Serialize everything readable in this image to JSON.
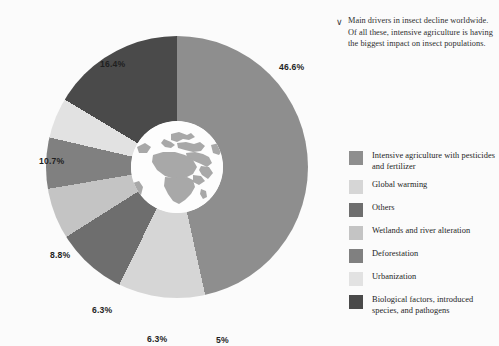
{
  "caption": {
    "marker": "∨",
    "text": "Main drivers in insect decline worldwide. Of all these, intensive agriculture is having the biggest impact on insect populations."
  },
  "legend": {
    "items": [
      {
        "label": "Intensive agriculture with pesticides and fertilizer",
        "color": "#8e8e8e"
      },
      {
        "label": "Global warming",
        "color": "#d6d6d6"
      },
      {
        "label": "Others",
        "color": "#6e6e6e"
      },
      {
        "label": "Wetlands and river alteration",
        "color": "#c4c4c4"
      },
      {
        "label": "Deforestation",
        "color": "#808080"
      },
      {
        "label": "Urbanization",
        "color": "#e2e2e2"
      },
      {
        "label": "Biological factors, introduced species, and pathogens",
        "color": "#4a4a4a"
      }
    ]
  },
  "chart_data": {
    "type": "pie",
    "title": "Main drivers in insect decline worldwide",
    "labels": [
      "Intensive agriculture with pesticides and fertilizer",
      "Global warming",
      "Others",
      "Wetlands and river alteration",
      "Deforestation",
      "Urbanization",
      "Biological factors, introduced species, and pathogens"
    ],
    "values": [
      46.6,
      10.7,
      8.8,
      6.3,
      6.3,
      5,
      16.4
    ],
    "value_labels": [
      "46.6%",
      "10.7%",
      "8.8%",
      "6.3%",
      "6.3%",
      "5%",
      "16.4%"
    ],
    "colors": [
      "#8e8e8e",
      "#d6d6d6",
      "#6e6e6e",
      "#c4c4c4",
      "#808080",
      "#e2e2e2",
      "#4a4a4a"
    ],
    "unit": "percent",
    "legend_position": "right",
    "center_graphic": "globe",
    "slice_label_positions": [
      {
        "text": "46.6%",
        "left": 257,
        "top": 40
      },
      {
        "text": "16.4%",
        "left": 78,
        "top": 37
      },
      {
        "text": "10.7%",
        "left": 17,
        "top": 134
      },
      {
        "text": "8.8%",
        "left": 28,
        "top": 228
      },
      {
        "text": "6.3%",
        "left": 70,
        "top": 283
      },
      {
        "text": "6.3%",
        "left": 125,
        "top": 312
      },
      {
        "text": "5%",
        "left": 194,
        "top": 313
      }
    ]
  }
}
